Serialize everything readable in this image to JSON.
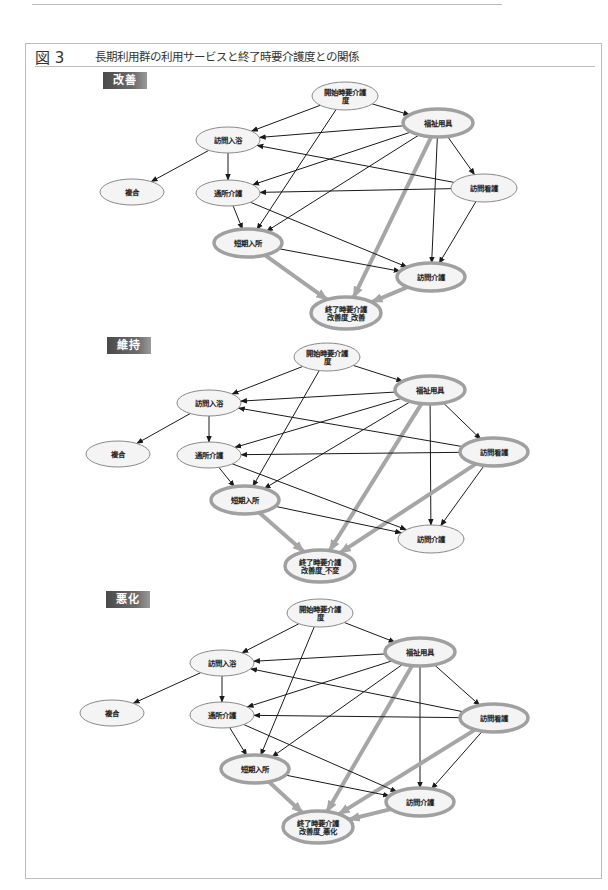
{
  "page": {
    "number": "155"
  },
  "figure": {
    "number": "図 3",
    "title": "長期利用群の利用サービスと終了時要介護度との関係"
  },
  "colors": {
    "thick_edge": "#a6a6a6",
    "thin_edge": "#1a1a1a",
    "node_fill": "#f4f4f4",
    "node_stroke": "#8a8a8a",
    "thick_node_stroke": "#a0a0a0"
  },
  "panels": [
    {
      "label": "改善",
      "badge_pos": [
        103,
        72
      ],
      "nodes": [
        {
          "id": "start",
          "lines": [
            "開始時要介護",
            "度"
          ],
          "x": 345,
          "y": 96,
          "rx": 33,
          "ry": 14,
          "thick": false
        },
        {
          "id": "welfare",
          "lines": [
            "福祉用具"
          ],
          "x": 438,
          "y": 123,
          "rx": 35,
          "ry": 14,
          "thick": true
        },
        {
          "id": "bath",
          "lines": [
            "訪問入浴"
          ],
          "x": 228,
          "y": 140,
          "rx": 32,
          "ry": 13,
          "thick": false
        },
        {
          "id": "nurse",
          "lines": [
            "訪問看護"
          ],
          "x": 484,
          "y": 188,
          "rx": 33,
          "ry": 14,
          "thick": false
        },
        {
          "id": "multi",
          "lines": [
            "複合"
          ],
          "x": 132,
          "y": 192,
          "rx": 32,
          "ry": 13,
          "thick": false
        },
        {
          "id": "day",
          "lines": [
            "通所介護"
          ],
          "x": 228,
          "y": 193,
          "rx": 32,
          "ry": 13,
          "thick": false
        },
        {
          "id": "short",
          "lines": [
            "短期入所"
          ],
          "x": 248,
          "y": 243,
          "rx": 34,
          "ry": 14,
          "thick": true
        },
        {
          "id": "home",
          "lines": [
            "訪問介護"
          ],
          "x": 431,
          "y": 277,
          "rx": 34,
          "ry": 14,
          "thick": true
        },
        {
          "id": "end",
          "lines": [
            "終了時要介護",
            "改善度_改善"
          ],
          "x": 346,
          "y": 313,
          "rx": 35,
          "ry": 16,
          "thick": true
        }
      ],
      "edges": [
        [
          "start",
          "bath",
          false
        ],
        [
          "start",
          "welfare",
          false
        ],
        [
          "start",
          "short",
          false
        ],
        [
          "welfare",
          "bath",
          false
        ],
        [
          "welfare",
          "day",
          false
        ],
        [
          "welfare",
          "short",
          false
        ],
        [
          "welfare",
          "nurse",
          false
        ],
        [
          "welfare",
          "home",
          false
        ],
        [
          "welfare",
          "end",
          true
        ],
        [
          "nurse",
          "bath",
          false
        ],
        [
          "nurse",
          "day",
          false
        ],
        [
          "nurse",
          "home",
          false
        ],
        [
          "bath",
          "multi",
          false
        ],
        [
          "bath",
          "day",
          false
        ],
        [
          "day",
          "short",
          false
        ],
        [
          "day",
          "home",
          false
        ],
        [
          "short",
          "home",
          false
        ],
        [
          "short",
          "end",
          true
        ],
        [
          "home",
          "end",
          true
        ]
      ]
    },
    {
      "label": "維持",
      "badge_pos": [
        107,
        337
      ],
      "nodes": [
        {
          "id": "start",
          "lines": [
            "開始時要介護",
            "度"
          ],
          "x": 327,
          "y": 357,
          "rx": 33,
          "ry": 14,
          "thick": false
        },
        {
          "id": "welfare",
          "lines": [
            "福祉用具"
          ],
          "x": 430,
          "y": 390,
          "rx": 35,
          "ry": 14,
          "thick": true
        },
        {
          "id": "bath",
          "lines": [
            "訪問入浴"
          ],
          "x": 209,
          "y": 403,
          "rx": 32,
          "ry": 13,
          "thick": false
        },
        {
          "id": "nurse",
          "lines": [
            "訪問看護"
          ],
          "x": 494,
          "y": 452,
          "rx": 34,
          "ry": 14,
          "thick": true
        },
        {
          "id": "multi",
          "lines": [
            "複合"
          ],
          "x": 118,
          "y": 454,
          "rx": 32,
          "ry": 13,
          "thick": false
        },
        {
          "id": "day",
          "lines": [
            "通所介護"
          ],
          "x": 209,
          "y": 455,
          "rx": 32,
          "ry": 13,
          "thick": false
        },
        {
          "id": "short",
          "lines": [
            "短期入所"
          ],
          "x": 245,
          "y": 500,
          "rx": 34,
          "ry": 14,
          "thick": true
        },
        {
          "id": "home",
          "lines": [
            "訪問介護"
          ],
          "x": 431,
          "y": 539,
          "rx": 33,
          "ry": 14,
          "thick": false
        },
        {
          "id": "end",
          "lines": [
            "終了時要介護",
            "改善度_不変"
          ],
          "x": 320,
          "y": 566,
          "rx": 35,
          "ry": 16,
          "thick": true
        }
      ],
      "edges": [
        [
          "start",
          "bath",
          false
        ],
        [
          "start",
          "welfare",
          false
        ],
        [
          "start",
          "short",
          false
        ],
        [
          "welfare",
          "bath",
          false
        ],
        [
          "welfare",
          "day",
          false
        ],
        [
          "welfare",
          "short",
          false
        ],
        [
          "welfare",
          "nurse",
          false
        ],
        [
          "welfare",
          "home",
          false
        ],
        [
          "welfare",
          "end",
          true
        ],
        [
          "nurse",
          "bath",
          false
        ],
        [
          "nurse",
          "day",
          false
        ],
        [
          "nurse",
          "home",
          false
        ],
        [
          "nurse",
          "end",
          true
        ],
        [
          "bath",
          "multi",
          false
        ],
        [
          "bath",
          "day",
          false
        ],
        [
          "day",
          "short",
          false
        ],
        [
          "day",
          "home",
          false
        ],
        [
          "short",
          "home",
          false
        ],
        [
          "short",
          "end",
          true
        ]
      ]
    },
    {
      "label": "悪化",
      "badge_pos": [
        106,
        591
      ],
      "nodes": [
        {
          "id": "start",
          "lines": [
            "開始時要介護",
            "度"
          ],
          "x": 320,
          "y": 613,
          "rx": 33,
          "ry": 14,
          "thick": false
        },
        {
          "id": "welfare",
          "lines": [
            "福祉用具"
          ],
          "x": 420,
          "y": 652,
          "rx": 35,
          "ry": 14,
          "thick": true
        },
        {
          "id": "bath",
          "lines": [
            "訪問入浴"
          ],
          "x": 222,
          "y": 663,
          "rx": 32,
          "ry": 13,
          "thick": false
        },
        {
          "id": "nurse",
          "lines": [
            "訪問看護"
          ],
          "x": 494,
          "y": 718,
          "rx": 34,
          "ry": 14,
          "thick": true
        },
        {
          "id": "multi",
          "lines": [
            "複合"
          ],
          "x": 112,
          "y": 713,
          "rx": 32,
          "ry": 13,
          "thick": false
        },
        {
          "id": "day",
          "lines": [
            "通所介護"
          ],
          "x": 222,
          "y": 715,
          "rx": 32,
          "ry": 13,
          "thick": false
        },
        {
          "id": "short",
          "lines": [
            "短期入所"
          ],
          "x": 255,
          "y": 769,
          "rx": 34,
          "ry": 14,
          "thick": true
        },
        {
          "id": "home",
          "lines": [
            "訪問介護"
          ],
          "x": 420,
          "y": 802,
          "rx": 34,
          "ry": 14,
          "thick": true
        },
        {
          "id": "end",
          "lines": [
            "終了時要介護",
            "改善度_悪化"
          ],
          "x": 318,
          "y": 827,
          "rx": 35,
          "ry": 16,
          "thick": true
        }
      ],
      "edges": [
        [
          "start",
          "bath",
          false
        ],
        [
          "start",
          "welfare",
          false
        ],
        [
          "start",
          "short",
          false
        ],
        [
          "welfare",
          "bath",
          false
        ],
        [
          "welfare",
          "day",
          false
        ],
        [
          "welfare",
          "short",
          false
        ],
        [
          "welfare",
          "nurse",
          false
        ],
        [
          "welfare",
          "home",
          false
        ],
        [
          "welfare",
          "end",
          true
        ],
        [
          "nurse",
          "bath",
          false
        ],
        [
          "nurse",
          "day",
          false
        ],
        [
          "nurse",
          "home",
          false
        ],
        [
          "nurse",
          "end",
          true
        ],
        [
          "bath",
          "multi",
          false
        ],
        [
          "bath",
          "day",
          false
        ],
        [
          "day",
          "short",
          false
        ],
        [
          "day",
          "home",
          false
        ],
        [
          "short",
          "home",
          false
        ],
        [
          "short",
          "end",
          true
        ],
        [
          "home",
          "end",
          true
        ]
      ]
    }
  ]
}
